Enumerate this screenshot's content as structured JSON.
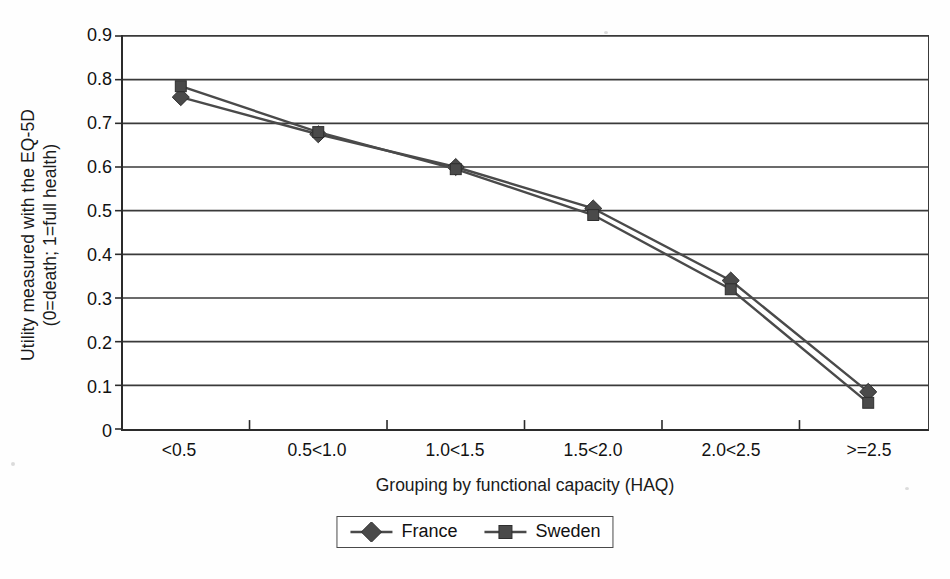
{
  "chart_data": {
    "type": "line",
    "title": "",
    "xlabel": "Grouping by functional capacity (HAQ)",
    "ylabel_line1": "Utility measured with the EQ-5D",
    "ylabel_line2": "(0=death; 1=full health)",
    "categories": [
      "<0.5",
      "0.5<1.0",
      "1.0<1.5",
      "1.5<2.0",
      "2.0<2.5",
      ">=2.5"
    ],
    "series": [
      {
        "name": "France",
        "marker": "diamond",
        "color": "#4a4a4a",
        "values": [
          0.76,
          0.675,
          0.6,
          0.505,
          0.34,
          0.085
        ]
      },
      {
        "name": "Sweden",
        "marker": "square",
        "color": "#4a4a4a",
        "values": [
          0.785,
          0.68,
          0.595,
          0.49,
          0.32,
          0.06
        ]
      }
    ],
    "ylim": [
      0,
      0.9
    ],
    "yticks": [
      "0",
      "0.1",
      "0.2",
      "0.3",
      "0.4",
      "0.5",
      "0.6",
      "0.7",
      "0.8",
      "0.9"
    ],
    "ytick_values": [
      0,
      0.1,
      0.2,
      0.3,
      0.4,
      0.5,
      0.6,
      0.7,
      0.8,
      0.9
    ],
    "grid": true,
    "legend_position": "bottom"
  },
  "legend": {
    "items": [
      {
        "label": "France",
        "marker": "diamond"
      },
      {
        "label": "Sweden",
        "marker": "square"
      }
    ]
  },
  "colors": {
    "series": "#4a4a4a",
    "axis": "#2b2b2b",
    "grid": "#3a3a3a",
    "text": "#111111",
    "background": "#ffffff"
  }
}
